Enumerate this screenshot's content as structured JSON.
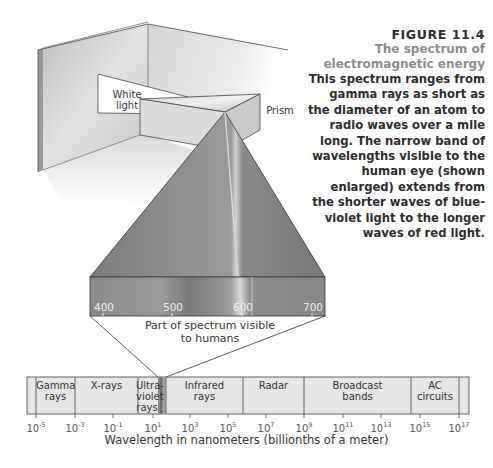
{
  "caption": {
    "figure_number": "FIGURE 11.4",
    "title_line1": "The spectrum of",
    "title_line2": "electromagnetic energy",
    "body_lines": [
      "This spectrum ranges from",
      "gamma rays as short as",
      "the diameter of an atom to",
      "radio waves over a mile",
      "long. The narrow band of",
      "wavelengths visible to the",
      "human eye (shown",
      "enlarged) extends from",
      "the shorter waves of blue-",
      "violet light to the longer",
      "waves of red light."
    ]
  },
  "illustration": {
    "white_light_label_line1": "White",
    "white_light_label_line2": "light",
    "prism_label": "Prism"
  },
  "visible_band": {
    "ticks": [
      "400",
      "500",
      "600",
      "700"
    ],
    "caption_line1": "Part of spectrum visible",
    "caption_line2": "to humans"
  },
  "spectrum_bar": {
    "bands": [
      {
        "line1": "Gamma",
        "line2": "rays",
        "line3": ""
      },
      {
        "line1": "X-rays",
        "line2": "",
        "line3": ""
      },
      {
        "line1": "Ultra-",
        "line2": "violet",
        "line3": "rays"
      },
      {
        "line1": "Infrared",
        "line2": "rays",
        "line3": ""
      },
      {
        "line1": "Radar",
        "line2": "",
        "line3": ""
      },
      {
        "line1": "Broadcast",
        "line2": "bands",
        "line3": ""
      },
      {
        "line1": "AC",
        "line2": "circuits",
        "line3": ""
      }
    ],
    "axis_ticks": [
      {
        "base": "10",
        "exp": "-5"
      },
      {
        "base": "10",
        "exp": "-3"
      },
      {
        "base": "10",
        "exp": "-1"
      },
      {
        "base": "10",
        "exp": "1"
      },
      {
        "base": "10",
        "exp": "3"
      },
      {
        "base": "10",
        "exp": "5"
      },
      {
        "base": "10",
        "exp": "7"
      },
      {
        "base": "10",
        "exp": "9"
      },
      {
        "base": "10",
        "exp": "11"
      },
      {
        "base": "10",
        "exp": "13"
      },
      {
        "base": "10",
        "exp": "15"
      },
      {
        "base": "10",
        "exp": "17"
      }
    ],
    "axis_title": "Wavelength in nanometers (billionths of a meter)"
  },
  "colors": {
    "bar_fill": "#e6e6e6",
    "bar_border": "#555555",
    "title_gray": "#8c8c8c",
    "text": "#2d2d2d"
  }
}
